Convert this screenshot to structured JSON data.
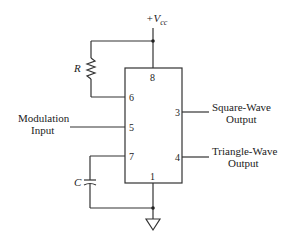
{
  "diagram": {
    "type": "circuit-schematic",
    "supply_label": "+V",
    "supply_subscript": "cc",
    "resistor_label": "R",
    "capacitor_label": "C",
    "pins": {
      "p8": "8",
      "p6": "6",
      "p5": "5",
      "p7": "7",
      "p1": "1",
      "p3": "3",
      "p4": "4"
    },
    "inputs": {
      "modulation_line1": "Modulation",
      "modulation_line2": "Input"
    },
    "outputs": {
      "square_line1": "Square-Wave",
      "square_line2": "Output",
      "triangle_line1": "Triangle-Wave",
      "triangle_line2": "Output"
    }
  }
}
